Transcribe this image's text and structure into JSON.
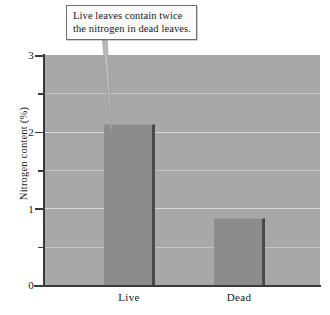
{
  "chart_data": {
    "type": "bar",
    "title": "",
    "subtitle": "",
    "xlabel": "",
    "ylabel": "Nitrogen content (%)",
    "categories": [
      "Live",
      "Dead"
    ],
    "values": [
      2.1,
      0.87
    ],
    "series": [
      {
        "name": "Nitrogen content",
        "values": [
          2.1,
          0.87
        ]
      }
    ],
    "ylim": [
      0,
      3
    ],
    "ytick_labels": [
      "0",
      "1",
      "2",
      "3"
    ],
    "ytick_values": [
      0,
      1,
      2,
      3
    ],
    "minor_tick_values": [
      0.5,
      1.5,
      2.5
    ],
    "grid": true,
    "grid_axis": "y",
    "legend": false,
    "legend_position": "none",
    "annotations": [
      {
        "text": "Live leaves contain twice the nitrogen in dead leaves.",
        "line1": "Live leaves contain twice",
        "line2": "the nitrogen in dead leaves.",
        "points_to": "Live"
      }
    ],
    "colors": {
      "plot_background": "#a8a8a8",
      "gridline": "#d8d8d8",
      "bar_fill": "#8c8c8c",
      "bar_shadow": "#4a4a4a",
      "axis": "#3a3a3a",
      "figure_background": "#ffffff",
      "callout_fill": "#fbfbfb",
      "callout_border": "#6e6e6e",
      "text": "#1a1a1a"
    }
  },
  "axis": {
    "y_title": "Nitrogen content (%)",
    "ticks": {
      "t0": "0",
      "t1": "1",
      "t2": "2",
      "t3": "3"
    }
  },
  "categories": {
    "live": "Live",
    "dead": "Dead"
  },
  "callout": {
    "line1": "Live leaves contain twice",
    "line2": "the nitrogen in dead leaves."
  }
}
